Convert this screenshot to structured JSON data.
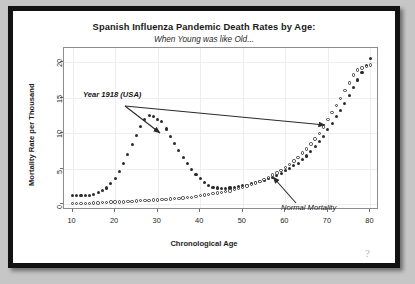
{
  "chart_data": {
    "type": "scatter",
    "title": "Spanish Influenza Pandemic Death Rates by Age:",
    "subtitle": "When Young was like Old...",
    "xlabel": "Chronological Age",
    "ylabel": "Mortality Rate per Thousand",
    "xlim": [
      8,
      82
    ],
    "ylim": [
      -0.8,
      22
    ],
    "xticks": [
      10,
      20,
      30,
      40,
      50,
      60,
      70,
      80
    ],
    "yticks": [
      0,
      5,
      10,
      15,
      20
    ],
    "grid": true,
    "legend_position": "none",
    "annotations": [
      {
        "text": "Year 1918 (USA)",
        "points_to": "1918 pandemic series",
        "style": "bold-italic"
      },
      {
        "text": "Normal Mortality",
        "points_to": "normal mortality series",
        "style": "italic"
      }
    ],
    "series": [
      {
        "name": "Year 1918 (USA)",
        "marker": "filled-circle",
        "color": "#2b2b2b",
        "x": [
          10,
          11,
          12,
          13,
          14,
          15,
          16,
          17,
          18,
          19,
          20,
          21,
          22,
          23,
          24,
          25,
          26,
          27,
          28,
          29,
          30,
          31,
          32,
          33,
          34,
          35,
          36,
          37,
          38,
          39,
          40,
          41,
          42,
          43,
          44,
          45,
          46,
          47,
          48,
          49,
          50,
          51,
          52,
          53,
          54,
          55,
          56,
          57,
          58,
          59,
          60,
          61,
          62,
          63,
          64,
          65,
          66,
          67,
          68,
          69,
          70,
          71,
          72,
          73,
          74,
          75,
          76,
          77,
          78,
          79,
          80
        ],
        "values": [
          1.2,
          1.2,
          1.2,
          1.2,
          1.3,
          1.4,
          1.6,
          1.9,
          2.3,
          2.9,
          3.6,
          4.6,
          5.7,
          7.0,
          8.4,
          9.7,
          11.0,
          12.0,
          12.5,
          12.4,
          12.0,
          11.7,
          10.6,
          9.6,
          8.6,
          7.6,
          6.6,
          5.7,
          4.9,
          4.2,
          3.6,
          3.1,
          2.7,
          2.4,
          2.3,
          2.2,
          2.2,
          2.3,
          2.4,
          2.5,
          2.6,
          2.7,
          2.9,
          3.1,
          3.2,
          3.4,
          3.6,
          3.8,
          4.1,
          4.4,
          4.7,
          5.0,
          5.4,
          5.8,
          6.3,
          6.8,
          7.4,
          8.1,
          8.8,
          9.6,
          10.5,
          11.4,
          12.3,
          13.2,
          14.2,
          15.3,
          16.4,
          17.5,
          18.5,
          19.6,
          20.5
        ]
      },
      {
        "name": "Normal Mortality",
        "marker": "open-circle",
        "color": "#3a3a3a",
        "x": [
          10,
          11,
          12,
          13,
          14,
          15,
          16,
          17,
          18,
          19,
          20,
          21,
          22,
          23,
          24,
          25,
          26,
          27,
          28,
          29,
          30,
          31,
          32,
          33,
          34,
          35,
          36,
          37,
          38,
          39,
          40,
          41,
          42,
          43,
          44,
          45,
          46,
          47,
          48,
          49,
          50,
          51,
          52,
          53,
          54,
          55,
          56,
          57,
          58,
          59,
          60,
          61,
          62,
          63,
          64,
          65,
          66,
          67,
          68,
          69,
          70,
          71,
          72,
          73,
          74,
          75,
          76,
          77,
          78,
          79,
          80
        ],
        "values": [
          0.1,
          0.1,
          0.1,
          0.15,
          0.15,
          0.2,
          0.2,
          0.25,
          0.25,
          0.3,
          0.3,
          0.35,
          0.35,
          0.4,
          0.4,
          0.45,
          0.5,
          0.5,
          0.55,
          0.6,
          0.6,
          0.65,
          0.7,
          0.75,
          0.8,
          0.85,
          0.9,
          0.95,
          1.0,
          1.1,
          1.2,
          1.3,
          1.4,
          1.5,
          1.6,
          1.7,
          1.8,
          1.9,
          2.1,
          2.2,
          2.4,
          2.6,
          2.8,
          3.0,
          3.2,
          3.5,
          3.8,
          4.1,
          4.4,
          4.8,
          5.2,
          5.6,
          6.1,
          6.6,
          7.2,
          7.8,
          8.5,
          9.2,
          10.0,
          10.9,
          11.9,
          12.9,
          13.9,
          14.9,
          16.0,
          17.1,
          18.2,
          18.9,
          19.2,
          19.4,
          19.6
        ]
      }
    ]
  },
  "artifact": {
    "mark": "?"
  }
}
